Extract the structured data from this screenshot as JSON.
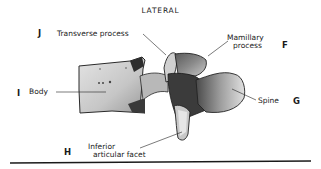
{
  "figure": {
    "title": "LATERAL",
    "view": "lateral view of a lumbar vertebra"
  },
  "labels": {
    "transverse_process": "Transverse process",
    "mamillary_process_line1": "Mamillary",
    "mamillary_process_line2": "process",
    "body": "Body",
    "spine": "Spine",
    "inferior_articular_facet_line1": "Inferior",
    "inferior_articular_facet_line2": "articular facet"
  },
  "letters": {
    "transverse_process": "J",
    "mamillary_process": "F",
    "body": "I",
    "spine": "G",
    "inferior_articular_facet": "H"
  },
  "colors": {
    "background": "#ffffff",
    "ink": "#1a1a1a",
    "bone_light": "#d9d9d9",
    "bone_mid": "#a8a8a8",
    "bone_dark": "#3a3a3a"
  }
}
